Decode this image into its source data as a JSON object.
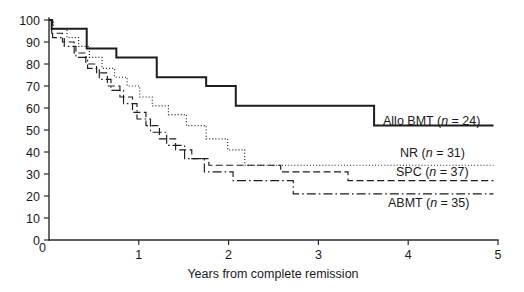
{
  "chart_data": {
    "type": "line",
    "title": "",
    "subtitle": "",
    "xlabel": "Years from complete remission",
    "ylabel": "",
    "xlim": [
      0,
      5
    ],
    "ylim": [
      0,
      100
    ],
    "xticks": [
      0,
      1,
      2,
      3,
      4,
      5
    ],
    "xtick_labels": [
      "0",
      "1",
      "2",
      "3",
      "4",
      "5"
    ],
    "yticks": [
      0,
      10,
      20,
      30,
      40,
      50,
      60,
      70,
      80,
      90,
      100
    ],
    "ytick_labels": [
      "0",
      "10",
      "20",
      "30",
      "40",
      "50",
      "60",
      "70",
      "80",
      "90",
      "100"
    ],
    "grid": false,
    "legend_position": "inline-right-of-curves",
    "step_type": "post",
    "series": [
      {
        "name": "Allo BMT",
        "n": 24,
        "label": "Allo BMT (n = 24)",
        "linestyle": "solid",
        "color": "#1d1d1d",
        "final_value": 52,
        "x": [
          0.0,
          0.03,
          0.4,
          0.42,
          0.72,
          0.75,
          1.17,
          1.2,
          1.72,
          1.75,
          2.05,
          2.08,
          3.58,
          3.62,
          4.95
        ],
        "y": [
          100,
          96,
          96,
          87,
          87,
          83,
          83,
          74,
          74,
          70,
          70,
          61,
          61,
          52,
          52
        ]
      },
      {
        "name": "NR",
        "n": 31,
        "label": "NR (n = 31)",
        "linestyle": "dotted",
        "color": "#1d1d1d",
        "final_value": 34,
        "x": [
          0.0,
          0.05,
          0.17,
          0.2,
          0.3,
          0.33,
          0.42,
          0.45,
          0.56,
          0.59,
          0.7,
          0.73,
          0.84,
          0.87,
          0.98,
          1.01,
          1.12,
          1.15,
          1.3,
          1.33,
          1.5,
          1.53,
          1.72,
          1.75,
          1.96,
          1.99,
          2.15,
          2.18,
          4.95
        ],
        "y": [
          100,
          96,
          96,
          92,
          92,
          88,
          88,
          83,
          83,
          78,
          78,
          74,
          74,
          70,
          70,
          65,
          65,
          61,
          61,
          57,
          57,
          52,
          52,
          46,
          46,
          41,
          41,
          34,
          34
        ]
      },
      {
        "name": "SPC",
        "n": 37,
        "label": "SPC (n = 37)",
        "linestyle": "dashed",
        "color": "#1d1d1d",
        "final_value": 27,
        "x": [
          0.0,
          0.03,
          0.12,
          0.15,
          0.25,
          0.28,
          0.38,
          0.41,
          0.5,
          0.53,
          0.62,
          0.65,
          0.76,
          0.79,
          0.9,
          0.93,
          1.05,
          1.08,
          1.2,
          1.23,
          1.38,
          1.41,
          1.56,
          1.59,
          1.75,
          1.78,
          2.55,
          2.58,
          3.3,
          3.33,
          4.95
        ],
        "y": [
          100,
          94,
          94,
          90,
          90,
          85,
          85,
          80,
          80,
          76,
          76,
          70,
          70,
          65,
          65,
          58,
          58,
          52,
          52,
          46,
          46,
          41,
          41,
          37,
          37,
          34,
          34,
          31,
          31,
          27,
          27
        ]
      },
      {
        "name": "ABMT",
        "n": 35,
        "label": "ABMT (n = 35)",
        "linestyle": "dashdot",
        "color": "#1d1d1d",
        "final_value": 21,
        "x": [
          0.0,
          0.04,
          0.14,
          0.17,
          0.27,
          0.3,
          0.4,
          0.43,
          0.53,
          0.56,
          0.66,
          0.69,
          0.8,
          0.83,
          0.95,
          0.98,
          1.1,
          1.13,
          1.28,
          1.31,
          1.48,
          1.51,
          1.7,
          1.73,
          2.02,
          2.05,
          2.68,
          2.72,
          4.95
        ],
        "y": [
          100,
          92,
          92,
          88,
          88,
          83,
          83,
          78,
          78,
          73,
          73,
          68,
          68,
          62,
          62,
          55,
          55,
          49,
          49,
          43,
          43,
          37,
          37,
          31,
          31,
          27,
          27,
          21,
          21
        ]
      }
    ],
    "annotations": [
      {
        "text": "Allo BMT (n = 24)",
        "x": 4.0,
        "y": 52
      },
      {
        "text": "NR (n = 31)",
        "x": 3.55,
        "y": 34
      },
      {
        "text": "SPC (n = 37)",
        "x": 3.55,
        "y": 28
      },
      {
        "text": "ABMT (n = 35)",
        "x": 3.7,
        "y": 19
      }
    ]
  },
  "labels": {
    "xaxis_title": "Years from complete remission",
    "series": {
      "allo_bmt": {
        "name": "Allo BMT",
        "n_prefix": "(",
        "n_var": "n",
        "n_eq": " = 24)"
      },
      "nr": {
        "name": "NR",
        "n_prefix": "(",
        "n_var": "n",
        "n_eq": " = 31)"
      },
      "spc": {
        "name": "SPC",
        "n_prefix": "(",
        "n_var": "n",
        "n_eq": " = 37)"
      },
      "abmt": {
        "name": "ABMT",
        "n_prefix": "(",
        "n_var": "n",
        "n_eq": " = 35)"
      }
    },
    "xticks": [
      "0",
      "1",
      "2",
      "3",
      "4",
      "5"
    ],
    "yticks": [
      "100",
      "90",
      "80",
      "70",
      "60",
      "50",
      "40",
      "30",
      "20",
      "10",
      "0"
    ]
  }
}
